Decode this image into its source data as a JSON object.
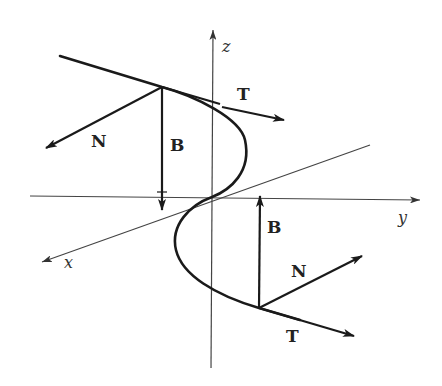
{
  "figure": {
    "colors": {
      "ink": "#1a1a1a",
      "axis": "#444444",
      "background": "#ffffff"
    }
  },
  "axes": {
    "x_label": "x",
    "y_label": "y",
    "z_label": "z"
  },
  "frame_top": {
    "tangent_label": "T",
    "normal_label": "N",
    "binormal_label": "B"
  },
  "frame_bottom": {
    "tangent_label": "T",
    "normal_label": "N",
    "binormal_label": "B"
  }
}
